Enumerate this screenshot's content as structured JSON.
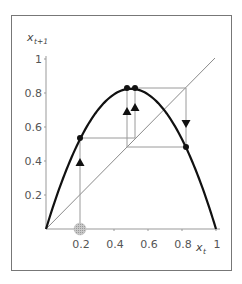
{
  "chart_data": {
    "type": "line",
    "title": "",
    "xlabel": "x_t",
    "ylabel": "x_{t+1}",
    "xlim": [
      0,
      1
    ],
    "ylim": [
      0,
      1
    ],
    "grid": false,
    "legend": null,
    "x_ticks": [
      "0.2",
      "0.4",
      "0.6",
      "0.8",
      "1"
    ],
    "y_ticks": [
      "0.2",
      "0.4",
      "0.6",
      "0.8",
      "1"
    ],
    "series": [
      {
        "name": "logistic map",
        "style": "thick black curve",
        "equation": "x_{t+1} = 3.3 x_t (1 - x_t)",
        "x": [
          0,
          0.1,
          0.2,
          0.3,
          0.4,
          0.5,
          0.6,
          0.7,
          0.8,
          0.9,
          1.0
        ],
        "values": [
          0,
          0.297,
          0.528,
          0.693,
          0.792,
          0.825,
          0.792,
          0.693,
          0.528,
          0.297,
          0
        ]
      },
      {
        "name": "diagonal",
        "style": "thin gray line",
        "x": [
          0,
          1
        ],
        "values": [
          0,
          1
        ]
      }
    ],
    "cobweb_points": [
      {
        "x": 0.2,
        "y": 0.535
      },
      {
        "x": 0.48,
        "y": 0.825
      },
      {
        "x": 0.525,
        "y": 0.825
      },
      {
        "x": 0.825,
        "y": 0.48
      }
    ],
    "start_marker": {
      "x": 0.2,
      "y": 0,
      "style": "gray hatched circle"
    },
    "arrows": [
      {
        "x": 0.2,
        "y": 0.4,
        "direction": "up"
      },
      {
        "x": 0.48,
        "y": 0.69,
        "direction": "up"
      },
      {
        "x": 0.525,
        "y": 0.71,
        "direction": "up"
      },
      {
        "x": 0.825,
        "y": 0.62,
        "direction": "down"
      }
    ]
  },
  "labels": {
    "x_axis": "x",
    "x_axis_sub": "t",
    "y_axis": "x",
    "y_axis_sub": "t+1",
    "xticks": [
      "0.2",
      "0.4",
      "0.6",
      "0.8",
      "1"
    ],
    "yticks": [
      "0.2",
      "0.4",
      "0.6",
      "0.8",
      "1"
    ]
  },
  "colors": {
    "curve": "#111111",
    "diagonal": "#888888",
    "cobweb": "#999999",
    "frame": "#777777",
    "start_marker": "#b5b5b5"
  }
}
